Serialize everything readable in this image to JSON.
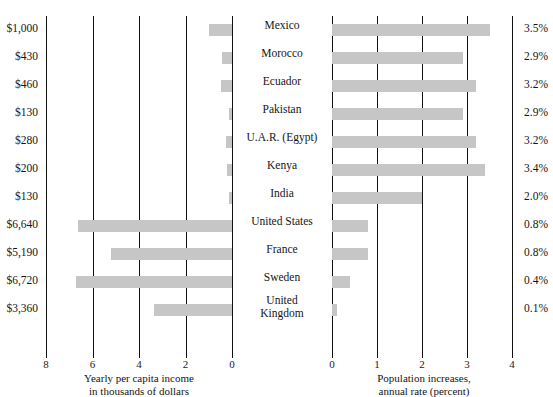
{
  "chart_data": {
    "type": "bar",
    "title": "",
    "orientation": "horizontal-diverging",
    "categories": [
      "Mexico",
      "Morocco",
      "Ecuador",
      "Pakistan",
      "U.A.R. (Egypt)",
      "Kenya",
      "India",
      "United States",
      "France",
      "Sweden",
      "United Kingdom"
    ],
    "series": [
      {
        "name": "Yearly per capita income in thousands of dollars",
        "axis": "left",
        "units": "thousands of dollars",
        "direction": "rightToLeft",
        "values": [
          1.0,
          0.43,
          0.46,
          0.13,
          0.28,
          0.2,
          0.13,
          6.64,
          5.19,
          6.72,
          3.36
        ],
        "labels": [
          "$1,000",
          "$430",
          "$460",
          "$130",
          "$280",
          "$200",
          "$130",
          "$6,640",
          "$5,190",
          "$6,720",
          "$3,360"
        ],
        "ticks": [
          8,
          6,
          4,
          2,
          0
        ],
        "tick_labels": [
          "8",
          "6",
          "4",
          "2",
          "0"
        ],
        "axis_min": 0,
        "axis_max": 8,
        "xlabel_line1": "Yearly per capita income",
        "xlabel_line2": "in thousands of dollars"
      },
      {
        "name": "Population increases, annual rate (percent)",
        "axis": "right",
        "units": "percent",
        "direction": "leftToRight",
        "values": [
          3.5,
          2.9,
          3.2,
          2.9,
          3.2,
          3.4,
          2.0,
          0.8,
          0.8,
          0.4,
          0.1
        ],
        "labels": [
          "3.5%",
          "2.9%",
          "3.2%",
          "2.9%",
          "3.2%",
          "3.4%",
          "2.0%",
          "0.8%",
          "0.8%",
          "0.4%",
          "0.1%"
        ],
        "ticks": [
          0,
          1,
          2,
          3,
          4
        ],
        "tick_labels": [
          "0",
          "1",
          "2",
          "3",
          "4"
        ],
        "axis_min": 0,
        "axis_max": 4,
        "xlabel_line1": "Population increases,",
        "xlabel_line2": "annual rate (percent)"
      }
    ],
    "grid": true,
    "legend": "none",
    "bar_color": "#c6c6c6",
    "axis_color": "#111111"
  },
  "rows": [
    {
      "name": "Mexico",
      "name_line2": "",
      "income_label": "$1,000",
      "income_value": 1.0,
      "pct_label": "3.5%",
      "pct_value": 3.5
    },
    {
      "name": "Morocco",
      "name_line2": "",
      "income_label": "$430",
      "income_value": 0.43,
      "pct_label": "2.9%",
      "pct_value": 2.9
    },
    {
      "name": "Ecuador",
      "name_line2": "",
      "income_label": "$460",
      "income_value": 0.46,
      "pct_label": "3.2%",
      "pct_value": 3.2
    },
    {
      "name": "Pakistan",
      "name_line2": "",
      "income_label": "$130",
      "income_value": 0.13,
      "pct_label": "2.9%",
      "pct_value": 2.9
    },
    {
      "name": "U.A.R. (Egypt)",
      "name_line2": "",
      "income_label": "$280",
      "income_value": 0.28,
      "pct_label": "3.2%",
      "pct_value": 3.2
    },
    {
      "name": "Kenya",
      "name_line2": "",
      "income_label": "$200",
      "income_value": 0.2,
      "pct_label": "3.4%",
      "pct_value": 3.4
    },
    {
      "name": "India",
      "name_line2": "",
      "income_label": "$130",
      "income_value": 0.13,
      "pct_label": "2.0%",
      "pct_value": 2.0
    },
    {
      "name": "United States",
      "name_line2": "",
      "income_label": "$6,640",
      "income_value": 6.64,
      "pct_label": "0.8%",
      "pct_value": 0.8
    },
    {
      "name": "France",
      "name_line2": "",
      "income_label": "$5,190",
      "income_value": 5.19,
      "pct_label": "0.8%",
      "pct_value": 0.8
    },
    {
      "name": "Sweden",
      "name_line2": "",
      "income_label": "$6,720",
      "income_value": 6.72,
      "pct_label": "0.4%",
      "pct_value": 0.4
    },
    {
      "name": "United",
      "name_line2": "Kingdom",
      "income_label": "$3,360",
      "income_value": 3.36,
      "pct_label": "0.1%",
      "pct_value": 0.1
    }
  ],
  "left_axis": {
    "ticks": [
      "8",
      "6",
      "4",
      "2",
      "0"
    ],
    "caption_line1": "Yearly per capita income",
    "caption_line2": "in thousands of dollars"
  },
  "right_axis": {
    "ticks": [
      "0",
      "1",
      "2",
      "3",
      "4"
    ],
    "caption_line1": "Population increases,",
    "caption_line2": "annual rate (percent)"
  }
}
